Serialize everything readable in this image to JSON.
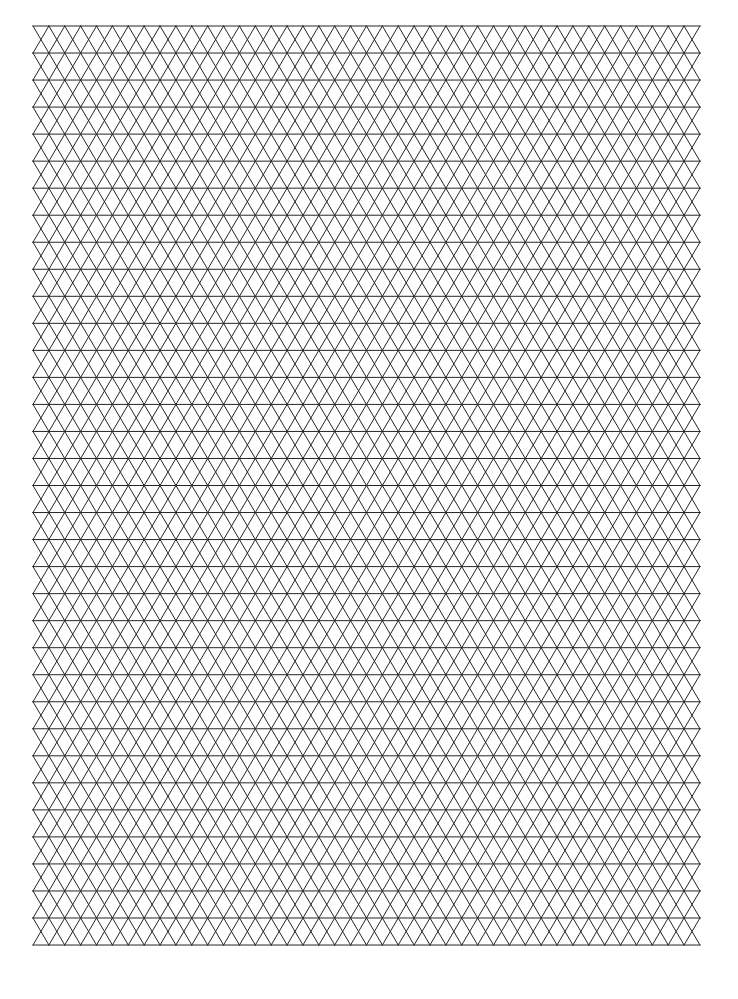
{
  "page": {
    "background_color": "#ffffff",
    "width": 738,
    "height": 999
  },
  "grid": {
    "name": "isometric-triangle-grid",
    "line_color": "#262626",
    "line_width": 1,
    "origin_x": 33,
    "origin_y": 26,
    "grid_width": 667,
    "grid_height": 919,
    "columns": 21,
    "rows": 34,
    "cell_width": 31.76,
    "row_height": 27.03,
    "horizontal_lines": 35,
    "diagonal_direction_count": 2,
    "note": ""
  },
  "chart_data": {
    "type": "line",
    "title": "",
    "xlabel": "",
    "ylabel": "",
    "grid": true,
    "legend": "none",
    "xlim": [
      33,
      700
    ],
    "ylim": [
      26,
      945
    ],
    "series": [
      {
        "name": "horizontal-lines",
        "values": []
      },
      {
        "name": "diagonal-down-right-lines",
        "values": []
      },
      {
        "name": "diagonal-down-left-lines",
        "values": []
      }
    ]
  }
}
